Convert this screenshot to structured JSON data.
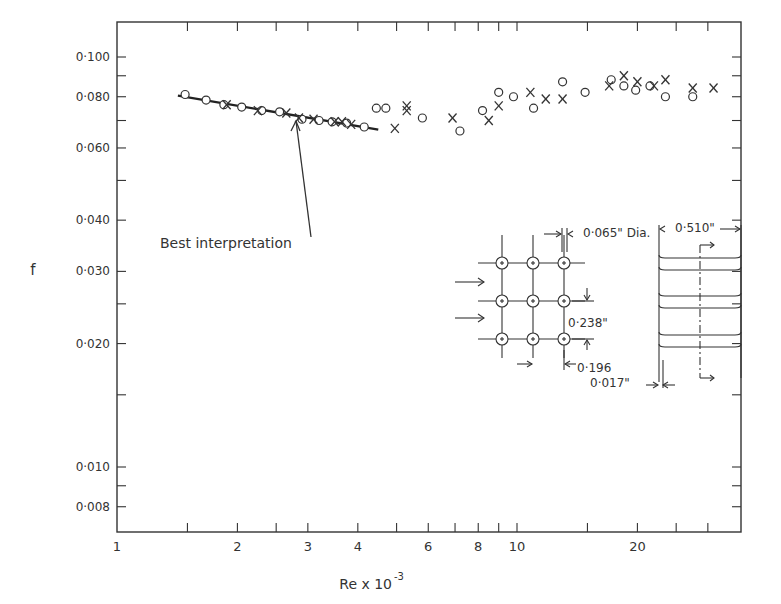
{
  "chart_data": {
    "type": "scatter",
    "title": "",
    "xlabel": "Re x 10",
    "xlabel_exponent": "-3",
    "ylabel": "f",
    "xscale": "log",
    "yscale": "log",
    "xlim": [
      1,
      36
    ],
    "ylim": [
      0.0066,
      0.122
    ],
    "grid": false,
    "legend": null,
    "x_tick_labels": [
      {
        "value": 1,
        "label": "1"
      },
      {
        "value": 2,
        "label": "2"
      },
      {
        "value": 3,
        "label": "3"
      },
      {
        "value": 4,
        "label": "4"
      },
      {
        "value": 6,
        "label": "6"
      },
      {
        "value": 8,
        "label": "8"
      },
      {
        "value": 10,
        "label": "10"
      },
      {
        "value": 20,
        "label": "20"
      }
    ],
    "x_minor_ticks": [
      1.5,
      2.5,
      5,
      7,
      9,
      15,
      25,
      30
    ],
    "y_tick_labels": [
      {
        "value": 0.1,
        "label": "0·100"
      },
      {
        "value": 0.08,
        "label": "0·080"
      },
      {
        "value": 0.06,
        "label": "0·060"
      },
      {
        "value": 0.04,
        "label": "0·040"
      },
      {
        "value": 0.03,
        "label": "0·030"
      },
      {
        "value": 0.02,
        "label": "0·020"
      },
      {
        "value": 0.01,
        "label": "0·010"
      },
      {
        "value": 0.008,
        "label": "0·008"
      }
    ],
    "y_minor_ticks": [
      0.09,
      0.07,
      0.05,
      0.025,
      0.015,
      0.009
    ],
    "series": [
      {
        "name": "circles",
        "marker": "o",
        "points": [
          [
            1.48,
            0.081
          ],
          [
            1.67,
            0.0785
          ],
          [
            1.85,
            0.0765
          ],
          [
            2.05,
            0.0755
          ],
          [
            2.3,
            0.074
          ],
          [
            2.55,
            0.0735
          ],
          [
            2.9,
            0.0705
          ],
          [
            3.2,
            0.07
          ],
          [
            3.45,
            0.0695
          ],
          [
            3.75,
            0.069
          ],
          [
            4.15,
            0.0675
          ],
          [
            4.45,
            0.075
          ],
          [
            4.7,
            0.075
          ],
          [
            5.8,
            0.071
          ],
          [
            7.2,
            0.066
          ],
          [
            8.2,
            0.074
          ],
          [
            9.0,
            0.082
          ],
          [
            9.8,
            0.08
          ],
          [
            11.0,
            0.075
          ],
          [
            13.0,
            0.087
          ],
          [
            14.8,
            0.082
          ],
          [
            17.2,
            0.088
          ],
          [
            18.5,
            0.085
          ],
          [
            19.8,
            0.083
          ],
          [
            21.5,
            0.085
          ],
          [
            23.5,
            0.08
          ],
          [
            27.5,
            0.08
          ]
        ]
      },
      {
        "name": "crosses",
        "marker": "x",
        "points": [
          [
            1.88,
            0.0765
          ],
          [
            2.25,
            0.074
          ],
          [
            2.65,
            0.073
          ],
          [
            2.85,
            0.071
          ],
          [
            3.1,
            0.0705
          ],
          [
            3.5,
            0.0695
          ],
          [
            3.65,
            0.0695
          ],
          [
            3.85,
            0.0685
          ],
          [
            4.95,
            0.067
          ],
          [
            5.3,
            0.076
          ],
          [
            5.3,
            0.074
          ],
          [
            6.9,
            0.071
          ],
          [
            8.5,
            0.07
          ],
          [
            9.0,
            0.076
          ],
          [
            10.8,
            0.082
          ],
          [
            11.8,
            0.079
          ],
          [
            13.0,
            0.079
          ],
          [
            17.0,
            0.085
          ],
          [
            18.5,
            0.09
          ],
          [
            20.0,
            0.087
          ],
          [
            22.0,
            0.085
          ],
          [
            23.5,
            0.088
          ],
          [
            27.5,
            0.084
          ],
          [
            31.0,
            0.084
          ]
        ]
      }
    ],
    "fit_line": {
      "name": "Best interpretation",
      "points": [
        [
          1.42,
          0.0805
        ],
        [
          4.5,
          0.0665
        ]
      ]
    },
    "annotations": [
      {
        "text": "Best interpretation",
        "arrow_to": [
          2.85,
          0.071
        ]
      }
    ],
    "inset_diagram": {
      "tube_diameter": "0·065\" Dia.",
      "transverse_pitch": "0·238\"",
      "longitudinal_pitch": "0·196",
      "fin_thickness": "0·017\"",
      "fin_spacing": "0·510\""
    }
  }
}
